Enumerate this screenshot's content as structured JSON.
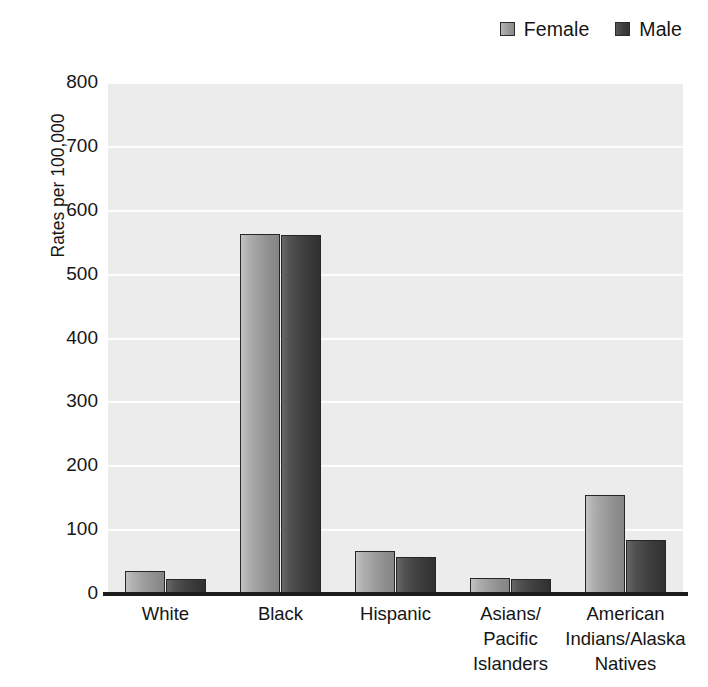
{
  "legend": {
    "position": "top-right",
    "entries": [
      {
        "label": "Female",
        "key": "female",
        "color": "#9a9a9a"
      },
      {
        "label": "Male",
        "key": "male",
        "color": "#3d3d3d"
      }
    ]
  },
  "axes": {
    "ylabel": "Rates per 100,000",
    "yticks": [
      "0",
      "100",
      "200",
      "300",
      "400",
      "500",
      "600",
      "700",
      "800"
    ]
  },
  "chart_data": {
    "type": "bar",
    "title": "",
    "xlabel": "",
    "ylabel": "Rates per 100,000",
    "ylim": [
      0,
      800
    ],
    "ytick_step": 100,
    "grid": true,
    "legend_position": "top-right",
    "categories": [
      "White",
      "Black",
      "Hispanic",
      "Asians/\nPacific\nIslanders",
      "American\nIndians/Alaska\nNatives"
    ],
    "category_lines": [
      [
        "White"
      ],
      [
        "Black"
      ],
      [
        "Hispanic"
      ],
      [
        "Asians/",
        "Pacific",
        "Islanders"
      ],
      [
        "American",
        "Indians/Alaska",
        "Natives"
      ]
    ],
    "series": [
      {
        "name": "Female",
        "color": "#9a9a9a",
        "values": [
          34,
          562,
          66,
          23,
          154
        ]
      },
      {
        "name": "Male",
        "color": "#3d3d3d",
        "values": [
          22,
          561,
          57,
          22,
          83
        ]
      }
    ]
  }
}
